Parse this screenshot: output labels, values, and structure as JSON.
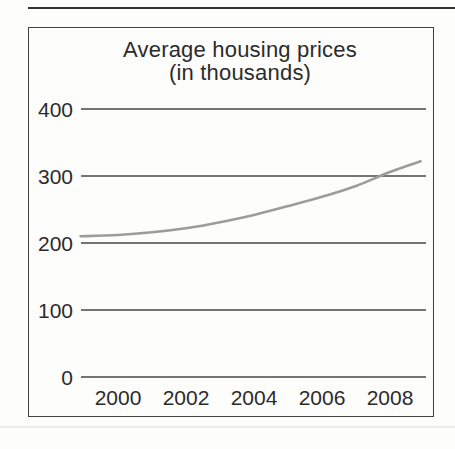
{
  "page": {
    "background": "#fdfdfc"
  },
  "dividers": {
    "top_color": "#333333",
    "bottom_color": "#ecebe8"
  },
  "chart": {
    "title_line1": "Average housing prices",
    "title_line2": "(in thousands)",
    "border_color": "#414141",
    "grid_color": "#474747",
    "text_color": "#2b2b2b"
  },
  "chart_data": {
    "type": "line",
    "title": "Average housing prices (in thousands)",
    "x": [
      1998.9,
      2000,
      2001,
      2002,
      2003,
      2004,
      2005,
      2006,
      2007,
      2008,
      2008.9
    ],
    "values": [
      210,
      212,
      216,
      222,
      231,
      242,
      255,
      269,
      285,
      306,
      322
    ],
    "xlabel": "",
    "ylabel": "",
    "xlim": [
      1998.7,
      2009.2
    ],
    "ylim": [
      0,
      430
    ],
    "x_tick_values": [
      2000,
      2002,
      2004,
      2006,
      2008
    ],
    "x_tick_labels": [
      "2000",
      "2002",
      "2004",
      "2006",
      "2008"
    ],
    "y_tick_values": [
      400,
      300,
      200,
      100,
      0
    ],
    "y_tick_labels": [
      "400",
      "300",
      "200",
      "100",
      "0"
    ],
    "grid": "horizontal-only",
    "legend": "none",
    "line_color": "#9c9c9c"
  }
}
